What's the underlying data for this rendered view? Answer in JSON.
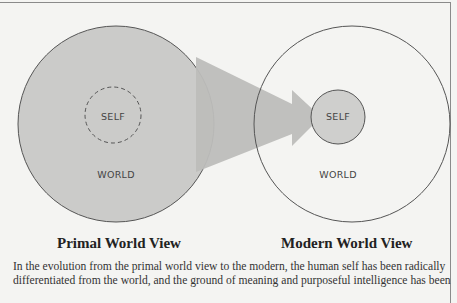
{
  "diagram": {
    "primal": {
      "self_label": "SELF",
      "world_label": "WORLD",
      "title": "Primal World View"
    },
    "modern": {
      "self_label": "SELF",
      "world_label": "WORLD",
      "title": "Modern World View"
    },
    "colors": {
      "fill_gray": "#c9c9c7",
      "arrow_gray": "#bdbdbb",
      "stroke": "#555555",
      "background": "#f4f4f2"
    }
  },
  "caption": {
    "line1": "In the evolution from the primal world view to the modern, the human self has been radically",
    "line2": "differentiated from the world, and the ground of meaning and purposeful intelligence has been"
  }
}
